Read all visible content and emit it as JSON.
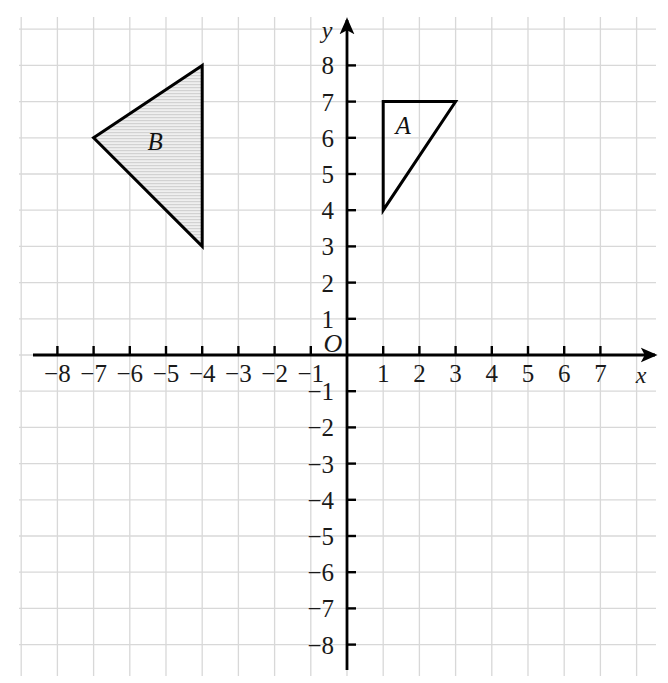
{
  "figure": {
    "type": "coordinate-plane",
    "background_color": "#ffffff",
    "grid_color": "#d8d8d8",
    "axis_color": "#000000",
    "origin_label": "O",
    "x_axis_label": "x",
    "y_axis_label": "y"
  },
  "chart_data": {
    "type": "scatter",
    "title": "",
    "xlabel": "x",
    "ylabel": "y",
    "xlim": [
      -9,
      8.5
    ],
    "ylim": [
      -9,
      9
    ],
    "grid": true,
    "grid_spacing": 1,
    "legend": "none",
    "x_tick_labels": [
      "−8",
      "−7",
      "−6",
      "−5",
      "−4",
      "−3",
      "−2",
      "−1",
      "1",
      "2",
      "3",
      "4",
      "5",
      "6",
      "7"
    ],
    "x_tick_values": [
      -8,
      -7,
      -6,
      -5,
      -4,
      -3,
      -2,
      -1,
      1,
      2,
      3,
      4,
      5,
      6,
      7
    ],
    "y_tick_labels": [
      "8",
      "7",
      "6",
      "5",
      "4",
      "3",
      "2",
      "1",
      "−1",
      "−2",
      "−3",
      "−4",
      "−5",
      "−6",
      "−7",
      "−8"
    ],
    "y_tick_values": [
      8,
      7,
      6,
      5,
      4,
      3,
      2,
      1,
      -1,
      -2,
      -3,
      -4,
      -5,
      -6,
      -7,
      -8
    ],
    "shapes": [
      {
        "name": "A",
        "label": "A",
        "kind": "triangle",
        "vertices": [
          [
            1,
            7
          ],
          [
            3,
            7
          ],
          [
            1,
            4
          ]
        ],
        "label_position": [
          1.55,
          6.1
        ],
        "fill": "none",
        "stroke": "#000000",
        "stroke_width": 3,
        "shaded": false
      },
      {
        "name": "B",
        "label": "B",
        "kind": "triangle",
        "vertices": [
          [
            -4,
            8
          ],
          [
            -7,
            6
          ],
          [
            -4,
            3
          ]
        ],
        "label_position": [
          -5.3,
          5.65
        ],
        "fill": "#e8e8e8",
        "stroke": "#000000",
        "stroke_width": 3,
        "shaded": true
      }
    ]
  }
}
